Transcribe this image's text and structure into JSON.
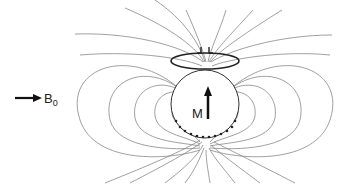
{
  "diagram": {
    "external_field": {
      "label": "B",
      "subscript": "0",
      "direction": "right"
    },
    "sphere": {
      "label": "M",
      "magnetization_direction": "up"
    },
    "coil": {
      "type": "loop coil with terminals",
      "position": "above sphere"
    },
    "colors": {
      "field_lines": "#888888",
      "outline": "#222222",
      "background": "#ffffff"
    }
  }
}
